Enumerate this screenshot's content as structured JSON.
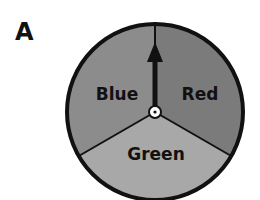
{
  "panel_label": "A",
  "spinner": {
    "sections": [
      {
        "label": "Blue",
        "color": "#8a8a8a"
      },
      {
        "label": "Red",
        "color": "#7a7a7a"
      },
      {
        "label": "Green",
        "color": "#a6a6a6"
      }
    ],
    "pointer": "arrow pointing up"
  }
}
